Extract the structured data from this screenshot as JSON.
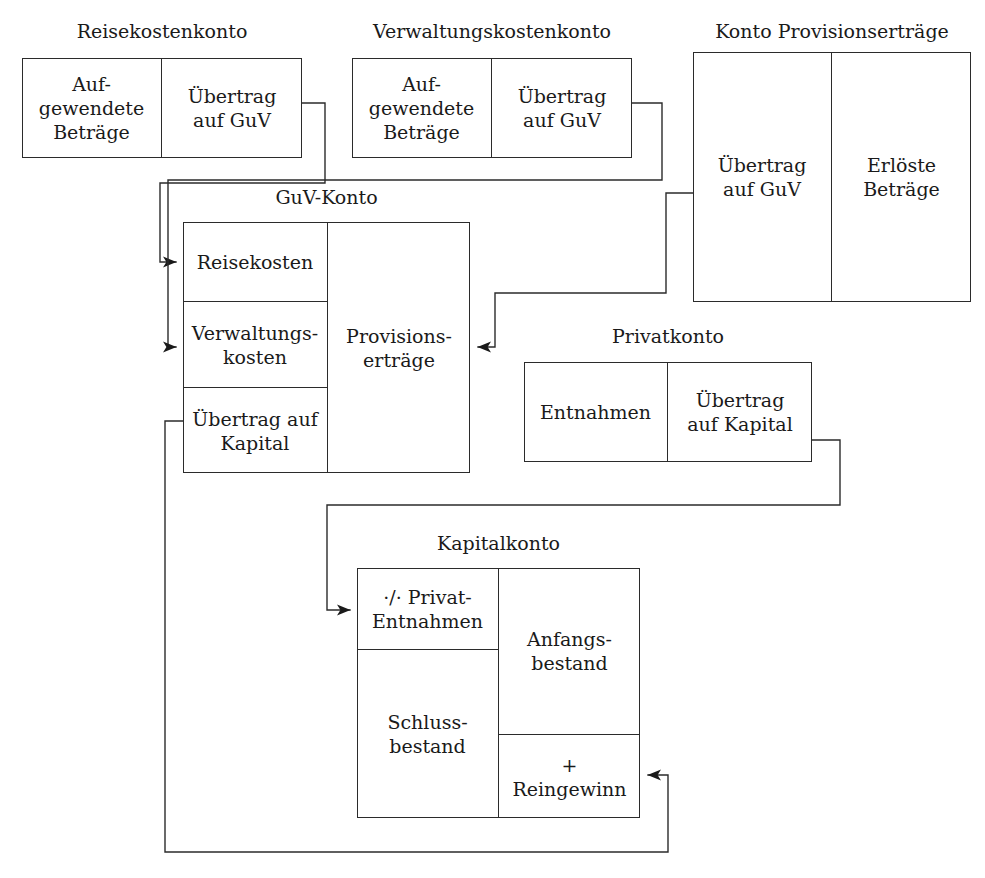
{
  "diagram": {
    "title_hidden": "Abschluss der Erfolgskonten über das GuV-Konto und das Kapitalkonto",
    "line_color": "#2b2b2b",
    "text_color": "#1a1a1a",
    "background": "#ffffff"
  },
  "accounts": [
    {
      "id": "reisekostenkonto",
      "title": "Reisekostenkonto",
      "debit": "Auf-\ngewendete\nBeträge",
      "credit": "Übertrag\nauf GuV"
    },
    {
      "id": "verwaltungskostenkonto",
      "title": "Verwaltungskostenkonto",
      "debit": "Auf-\ngewendete\nBeträge",
      "credit": "Übertrag\nauf GuV"
    },
    {
      "id": "konto-provisionsertraege",
      "title": "Konto Provisionserträge",
      "debit": "Übertrag\nauf GuV",
      "credit": "Erlöste\nBeträge"
    },
    {
      "id": "guv-konto",
      "title": "GuV-Konto",
      "debit_cells": [
        "Reisekosten",
        "Verwaltungs-\nkosten",
        "Übertrag auf\nKapital"
      ],
      "credit_cells": [
        "Provisions-\nerträge"
      ]
    },
    {
      "id": "privatkonto",
      "title": "Privatkonto",
      "debit": "Entnahmen",
      "credit": "Übertrag\nauf Kapital"
    },
    {
      "id": "kapitalkonto",
      "title": "Kapitalkonto",
      "debit_cells": [
        "·/· Privat-\nEntnahmen",
        "Schluss-\nbestand"
      ],
      "credit_cells": [
        "Anfangs-\nbestand",
        "+\nReingewinn"
      ]
    }
  ],
  "connectors": [
    {
      "id": "reisekosten-to-guv",
      "from": "reisekostenkonto.credit",
      "to": "guv-konto.reisekosten"
    },
    {
      "id": "verwaltungskosten-to-guv",
      "from": "verwaltungskostenkonto.credit",
      "to": "guv-konto.verwaltungskosten"
    },
    {
      "id": "provisionsertraege-to-guv",
      "from": "konto-provisionsertraege.debit",
      "to": "guv-konto.provisionsertraege"
    },
    {
      "id": "privatkonto-to-kapitalkonto",
      "from": "privatkonto.credit",
      "to": "kapitalkonto.privat-entnahmen"
    },
    {
      "id": "guv-to-kapitalkonto",
      "from": "guv-konto.uebertrag-auf-kapital",
      "to": "kapitalkonto.reingewinn"
    }
  ]
}
